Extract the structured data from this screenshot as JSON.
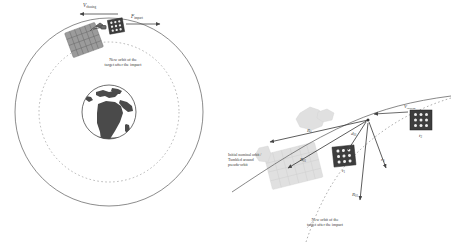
{
  "figure": {
    "type": "orbital-mechanics-diagram",
    "panels": 2,
    "colors": {
      "orbit_stroke": "#555555",
      "new_orbit_stroke": "#9a9a9a",
      "satellite_dark": "#3d3d3d",
      "spacecraft_gray": "#8a8a8a",
      "spacecraft_faint": "#d8d8d8",
      "earth_land": "#4a4a4a",
      "earth_ocean": "#ffffff",
      "text": "#3a3a3a",
      "background": "#ffffff"
    }
  },
  "left_panel": {
    "name": "impact-overview",
    "earth_label": "Earth",
    "orbits": {
      "outer_label": "original orbit",
      "inner_label": "new orbit"
    },
    "annotations": [
      {
        "id": "new-orbit-note",
        "line1": "New orbit of the",
        "line2": "target after the impact"
      }
    ],
    "vectors": [
      {
        "id": "v-chasing",
        "symbol": "V",
        "subscript": "chasing",
        "direction": "left"
      },
      {
        "id": "f-impact",
        "symbol": "F",
        "subscript": "impact",
        "direction": "right"
      }
    ],
    "bodies": [
      {
        "id": "chaser-spacecraft",
        "label": "chaser"
      },
      {
        "id": "target-satellite",
        "label": "target"
      }
    ]
  },
  "right_panel": {
    "name": "impact-detail",
    "annotations": [
      {
        "id": "initial-orbit-note",
        "line1": "Initial nominal orbit /",
        "line2": "Tumbled around",
        "line3": "pseudo-orbit"
      },
      {
        "id": "new-orbit-note",
        "line1": "New orbit of the",
        "line2": "target after the impact"
      }
    ],
    "vectors": [
      {
        "id": "v-chasing",
        "symbol": "V",
        "subscript": "chasing",
        "direction": "left"
      },
      {
        "id": "R-0",
        "symbol": "R",
        "subscript": "0"
      },
      {
        "id": "R-01",
        "symbol": "R",
        "subscript": "01"
      },
      {
        "id": "d-01",
        "symbol": "d",
        "subscript": "01"
      },
      {
        "id": "r-0",
        "symbol": "r",
        "subscript": "0"
      },
      {
        "id": "R-01b",
        "symbol": "R",
        "subscript": "01"
      }
    ],
    "bodies": [
      {
        "id": "target-t1",
        "label_symbol": "t",
        "label_sub": "1"
      },
      {
        "id": "target-t2",
        "label_symbol": "t",
        "label_sub": "2"
      },
      {
        "id": "chaser-faint",
        "label": "chaser spacecraft"
      }
    ]
  }
}
